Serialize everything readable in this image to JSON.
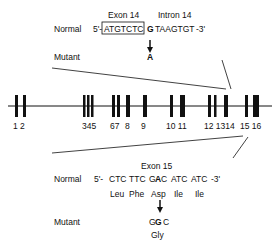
{
  "top": {
    "exon_label": "Exon 14",
    "intron_label": "Intron 14",
    "normal_label": "Normal",
    "prefix": "5'-",
    "exon_seq": "ATGTCTC",
    "mut_base": "G",
    "intron_seq": "TAAGTGT",
    "suffix": "-3'",
    "mutant_label": "Mutant",
    "mutant_base": "A"
  },
  "gene": {
    "exon_numbers": [
      "1 2",
      "345",
      "67",
      "8",
      "9",
      "10 11",
      "12 1314",
      "15 16"
    ]
  },
  "bottom": {
    "exon_label": "Exon 15",
    "normal_label": "Normal",
    "prefix": "5'-",
    "codons": [
      "CTC",
      "TTC",
      "G",
      "A",
      "C",
      "ATC",
      "ATC"
    ],
    "suffix": "-3'",
    "amino_acids": [
      "Leu",
      "Phe",
      "Asp",
      "Ile",
      "Ile"
    ],
    "mutant_label": "Mutant",
    "mutant_codon_a": "G",
    "mutant_codon_b": "G",
    "mutant_codon_c": "C",
    "mutant_aa": "Gly"
  }
}
